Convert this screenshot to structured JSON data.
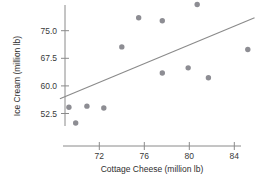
{
  "chart_data": {
    "type": "scatter",
    "title": "",
    "xlabel": "Cottage Cheese (million lb)",
    "ylabel": "Ice Cream (million lb)",
    "xlim": [
      68.3,
      86.6
    ],
    "ylim": [
      47.0,
      83.5
    ],
    "xticks": [
      72,
      76,
      80,
      84
    ],
    "xtick_labels": [
      "72",
      "76",
      "80",
      "84"
    ],
    "yticks": [
      52.5,
      60.0,
      67.5,
      75.0
    ],
    "ytick_labels": [
      "52.5",
      "60.0",
      "67.5",
      "75.0"
    ],
    "grid": false,
    "legend": null,
    "marker_color": "#8d8d93",
    "line_color": "#8a8a8a",
    "points": [
      {
        "x": 69.3,
        "y": 54.2
      },
      {
        "x": 69.9,
        "y": 49.9
      },
      {
        "x": 70.9,
        "y": 54.5
      },
      {
        "x": 72.4,
        "y": 54.0
      },
      {
        "x": 74.0,
        "y": 70.6
      },
      {
        "x": 75.5,
        "y": 78.5
      },
      {
        "x": 77.6,
        "y": 77.7
      },
      {
        "x": 77.6,
        "y": 63.5
      },
      {
        "x": 79.9,
        "y": 64.9
      },
      {
        "x": 80.7,
        "y": 82.1
      },
      {
        "x": 81.7,
        "y": 62.2
      },
      {
        "x": 85.2,
        "y": 69.9
      }
    ],
    "fit_line": {
      "name": "least-squares regression line",
      "x_start": 68.5,
      "y_start": 56.5,
      "x_end": 85.8,
      "y_end": 78.5
    }
  }
}
